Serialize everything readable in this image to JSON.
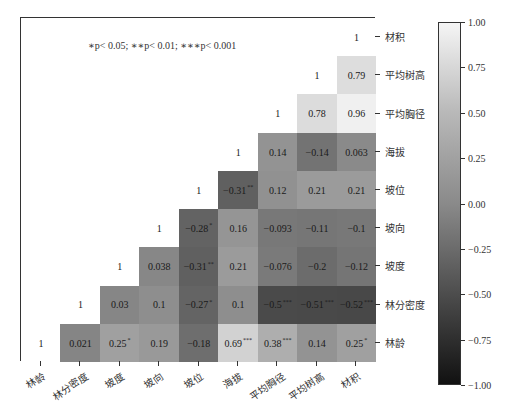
{
  "chart_data": {
    "type": "heatmap",
    "title": "",
    "annotation": "∗p< 0.05; ∗∗p< 0.01; ∗∗∗p< 0.001",
    "variables": [
      "林龄",
      "林分密度",
      "坡度",
      "坡向",
      "坡位",
      "海拔",
      "平均胸径",
      "平均树高",
      "材积"
    ],
    "x_tick_labels": [
      "林龄",
      "林分密度",
      "坡度",
      "坡向",
      "坡位",
      "海拔",
      "平均胸径",
      "平均树高",
      "材积"
    ],
    "y_tick_labels_top_to_bottom": [
      "材积",
      "平均树高",
      "平均胸径",
      "海拔",
      "坡位",
      "坡向",
      "坡度",
      "林分密度",
      "林龄"
    ],
    "layout": "lower-right triangle; diagonal of 1s; rows listed top-to-bottom",
    "rows": [
      {
        "row": "材积",
        "cells": [
          {
            "col": "材积",
            "v": "1",
            "s": ""
          }
        ]
      },
      {
        "row": "平均树高",
        "cells": [
          {
            "col": "平均树高",
            "v": "1",
            "s": ""
          },
          {
            "col": "材积",
            "v": "0.79",
            "s": ""
          }
        ]
      },
      {
        "row": "平均胸径",
        "cells": [
          {
            "col": "平均胸径",
            "v": "1",
            "s": ""
          },
          {
            "col": "平均树高",
            "v": "0.78",
            "s": ""
          },
          {
            "col": "材积",
            "v": "0.96",
            "s": ""
          }
        ]
      },
      {
        "row": "海拔",
        "cells": [
          {
            "col": "海拔",
            "v": "1",
            "s": ""
          },
          {
            "col": "平均胸径",
            "v": "0.14",
            "s": ""
          },
          {
            "col": "平均树高",
            "v": "-0.14",
            "s": ""
          },
          {
            "col": "材积",
            "v": "0.063",
            "s": ""
          }
        ]
      },
      {
        "row": "坡位",
        "cells": [
          {
            "col": "坡位",
            "v": "1",
            "s": ""
          },
          {
            "col": "海拔",
            "v": "-0.31",
            "s": "**"
          },
          {
            "col": "平均胸径",
            "v": "0.12",
            "s": ""
          },
          {
            "col": "平均树高",
            "v": "0.21",
            "s": ""
          },
          {
            "col": "材积",
            "v": "0.21",
            "s": ""
          }
        ]
      },
      {
        "row": "坡向",
        "cells": [
          {
            "col": "坡向",
            "v": "1",
            "s": ""
          },
          {
            "col": "坡位",
            "v": "-0.28",
            "s": "*"
          },
          {
            "col": "海拔",
            "v": "0.16",
            "s": ""
          },
          {
            "col": "平均胸径",
            "v": "-0.093",
            "s": ""
          },
          {
            "col": "平均树高",
            "v": "-0.11",
            "s": ""
          },
          {
            "col": "材积",
            "v": "-0.1",
            "s": ""
          }
        ]
      },
      {
        "row": "坡度",
        "cells": [
          {
            "col": "坡度",
            "v": "1",
            "s": ""
          },
          {
            "col": "坡向",
            "v": "0.038",
            "s": ""
          },
          {
            "col": "坡位",
            "v": "-0.31",
            "s": "**"
          },
          {
            "col": "海拔",
            "v": "0.21",
            "s": ""
          },
          {
            "col": "平均胸径",
            "v": "-0.076",
            "s": ""
          },
          {
            "col": "平均树高",
            "v": "-0.2",
            "s": ""
          },
          {
            "col": "材积",
            "v": "-0.12",
            "s": ""
          }
        ]
      },
      {
        "row": "林分密度",
        "cells": [
          {
            "col": "林分密度",
            "v": "1",
            "s": ""
          },
          {
            "col": "坡度",
            "v": "0.03",
            "s": ""
          },
          {
            "col": "坡向",
            "v": "0.1",
            "s": ""
          },
          {
            "col": "坡位",
            "v": "-0.27",
            "s": "*"
          },
          {
            "col": "海拔",
            "v": "0.1",
            "s": ""
          },
          {
            "col": "平均胸径",
            "v": "-0.5",
            "s": "***"
          },
          {
            "col": "平均树高",
            "v": "-0.51",
            "s": "***"
          },
          {
            "col": "材积",
            "v": "-0.52",
            "s": "***"
          }
        ]
      },
      {
        "row": "林龄",
        "cells": [
          {
            "col": "林龄",
            "v": "1",
            "s": ""
          },
          {
            "col": "林分密度",
            "v": "0.021",
            "s": ""
          },
          {
            "col": "坡度",
            "v": "0.25",
            "s": "*"
          },
          {
            "col": "坡向",
            "v": "0.19",
            "s": ""
          },
          {
            "col": "坡位",
            "v": "-0.18",
            "s": ""
          },
          {
            "col": "海拔",
            "v": "0.69",
            "s": "***"
          },
          {
            "col": "平均胸径",
            "v": "0.38",
            "s": "***"
          },
          {
            "col": "平均树高",
            "v": "0.14",
            "s": ""
          },
          {
            "col": "材积",
            "v": "0.25",
            "s": "*"
          }
        ]
      }
    ],
    "colorbar": {
      "min": -1.0,
      "max": 1.0,
      "ticks": [
        "1.00",
        "0.75",
        "0.50",
        "0.25",
        "0.00",
        "-0.25",
        "-0.50",
        "-0.75",
        "-1.00"
      ],
      "colormap": "grayscale (dark = negative, light = positive)"
    },
    "grid": false
  }
}
